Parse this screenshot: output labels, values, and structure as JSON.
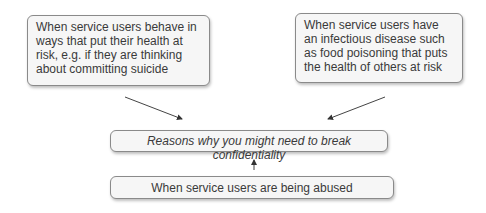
{
  "diagram": {
    "center": {
      "label": "Reasons why you might need to break confidentiality"
    },
    "reasons": [
      {
        "label": "When service users behave in ways that put their health at risk, e.g. if they are thinking about committing suicide"
      },
      {
        "label": "When service users have an infectious disease such as food poisoning that puts the health of others at risk"
      },
      {
        "label": "When service users are being abused"
      }
    ],
    "colors": {
      "box_fill": "#f6f6f6",
      "box_border": "#8a8a8a",
      "arrow": "#333333"
    }
  }
}
